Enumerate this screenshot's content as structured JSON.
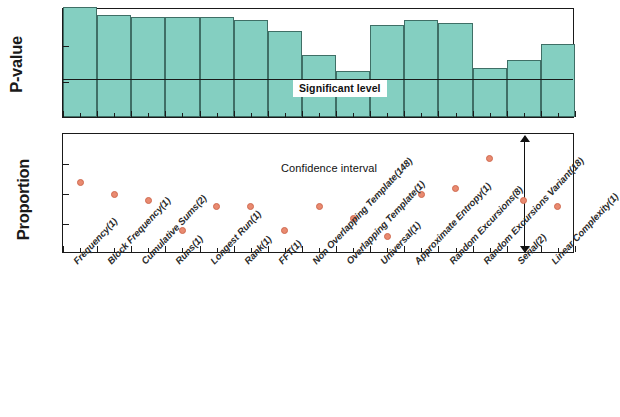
{
  "figure": {
    "colors": {
      "bar_fill": "#84cfc1",
      "bar_edge": "#3f6f66",
      "dot_fill": "#e98a70",
      "dot_edge": "#cf6a50",
      "axis": "#1a1a1a"
    }
  },
  "annotations": {
    "significant_level": "Significant level",
    "confidence_interval": "Confidence interval"
  },
  "chart_data": [
    {
      "type": "bar",
      "title": "",
      "xlabel": "",
      "ylabel": "P-value",
      "yscale": "log",
      "ylim": [
        0.001,
        1
      ],
      "ytick_labels": [
        "1",
        "0.1",
        "0.01",
        "0.001"
      ],
      "ytick_values": [
        1,
        0.1,
        0.01,
        0.001
      ],
      "grid": false,
      "threshold_label": "Significant level",
      "threshold_value": 0.01,
      "categories": [
        "Frequency(1)",
        "Block Frequency(1)",
        "Cumulative Sums(2)",
        "Runs(1)",
        "Longest Run(1)",
        "Rank(1)",
        "FFT(1)",
        "Non Overlapping Template(148)",
        "Overlapping Template(1)",
        "Universal(1)",
        "Approximate Entropy(1)",
        "Random Excursions(8)",
        "Random Excursions Variant(18)",
        "Serial(2)",
        "Linear Complexity(1)"
      ],
      "values": [
        1.0,
        0.62,
        0.55,
        0.53,
        0.53,
        0.43,
        0.22,
        0.048,
        0.018,
        0.32,
        0.45,
        0.36,
        0.022,
        0.035,
        0.1,
        0.022
      ]
    },
    {
      "type": "scatter",
      "title": "",
      "xlabel": "",
      "ylabel": "Proportion",
      "ylim": [
        0.98,
        1.0
      ],
      "ytick_labels": [
        "1.000",
        "0.995",
        "0.990",
        "0.985",
        "0.980"
      ],
      "ytick_values": [
        1.0,
        0.995,
        0.99,
        0.985,
        0.98
      ],
      "grid": false,
      "annotation_label": "Confidence interval",
      "categories": [
        "Frequency(1)",
        "Block Frequency(1)",
        "Cumulative Sums(2)",
        "Runs(1)",
        "Longest Run(1)",
        "Rank(1)",
        "FFT(1)",
        "Non Overlapping Template(148)",
        "Overlapping Template(1)",
        "Universal(1)",
        "Approximate Entropy(1)",
        "Random Excursions(8)",
        "Random Excursions Variant(18)",
        "Serial(2)",
        "Linear Complexity(1)"
      ],
      "values": [
        0.992,
        0.99,
        0.989,
        0.984,
        0.988,
        0.988,
        0.984,
        0.988,
        0.986,
        0.983,
        0.99,
        0.991,
        0.996,
        0.989,
        0.988
      ]
    }
  ],
  "x_axis": {
    "labels": [
      "Frequency(1)",
      "Block Frequency(1)",
      "Cumulative Sums(2)",
      "Runs(1)",
      "Longest Run(1)",
      "Rank(1)",
      "FFT(1)",
      "Non Overlapping Template(148)",
      "Overlapping Template(1)",
      "Universal(1)",
      "Approximate Entropy(1)",
      "Random Excursions(8)",
      "Random Excursions Variant(18)",
      "Serial(2)",
      "Linear Complexity(1)"
    ]
  }
}
